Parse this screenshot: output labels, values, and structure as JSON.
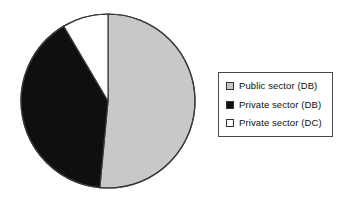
{
  "chart_data": {
    "type": "pie",
    "title": "",
    "subtitle": "",
    "xlabel": "",
    "ylabel": "",
    "grid": false,
    "legend_position": "right",
    "start_angle_deg": 0,
    "direction": "clockwise",
    "categories": [
      "Public sector (DB)",
      "Private sector (DB)",
      "Private sector (DC)"
    ],
    "values": [
      51.5,
      40.0,
      8.5
    ],
    "units": "percent",
    "slices": [
      {
        "label": "Public sector (DB)",
        "value": 51.5,
        "color": "#c8c8c8",
        "edge_color": "#3a3a3a",
        "start_angle_deg": 0,
        "end_angle_deg": 185.4
      },
      {
        "label": "Private sector (DB)",
        "value": 40.0,
        "color": "#0f0f0f",
        "edge_color": "#3a3a3a",
        "start_angle_deg": 185.4,
        "end_angle_deg": 329.4
      },
      {
        "label": "Private sector (DC)",
        "value": 8.5,
        "color": "#ffffff",
        "edge_color": "#3a3a3a",
        "start_angle_deg": 329.4,
        "end_angle_deg": 360
      }
    ]
  },
  "pie": {
    "center_x": 90,
    "center_y": 97,
    "radius": 87,
    "outline_color": "#3a3a3a"
  },
  "legend": {
    "border_color": "#4a4a4a",
    "background": "#ffffff",
    "items": [
      {
        "label": "Public sector (DB)",
        "swatch_color": "#c8c8c8",
        "swatch_border": "#333333"
      },
      {
        "label": "Private sector (DB)",
        "swatch_color": "#0f0f0f",
        "swatch_border": "#333333"
      },
      {
        "label": "Private sector (DC)",
        "swatch_color": "#ffffff",
        "swatch_border": "#333333"
      }
    ]
  }
}
